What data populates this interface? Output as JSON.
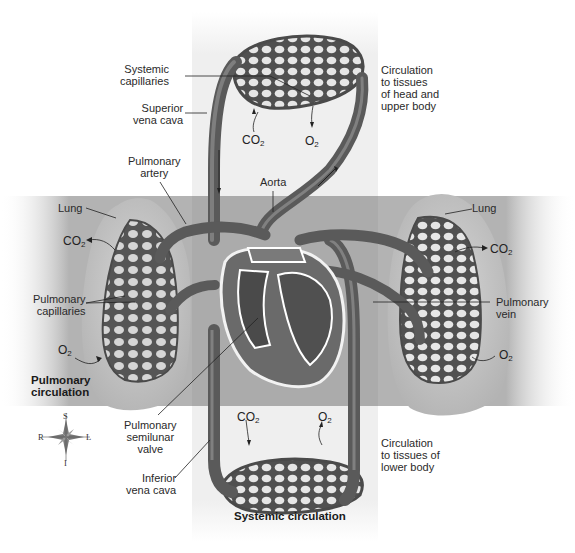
{
  "diagram": {
    "type": "anatomical-diagram"
  },
  "regions": {
    "pulmonary": {
      "label": "Pulmonary circulation",
      "band_color": "#a9a9a9"
    },
    "systemic": {
      "label": "Systemic circulation",
      "band_color": "#ececec"
    }
  },
  "labels": {
    "systemic_capillaries": {
      "line1": "Systemic",
      "line2": "capillaries"
    },
    "superior_vena_cava": {
      "line1": "Superior",
      "line2": "vena cava"
    },
    "pulmonary_artery": {
      "line1": "Pulmonary",
      "line2": "artery"
    },
    "aorta": "Aorta",
    "lung_left_side": "Lung",
    "lung_right_side": "Lung",
    "pulmonary_capillaries": {
      "line1": "Pulmonary",
      "line2": "capillaries"
    },
    "pulmonary_vein": {
      "line1": "Pulmonary",
      "line2": "vein"
    },
    "pulmonary_circulation": {
      "line1": "Pulmonary",
      "line2": "circulation"
    },
    "pulmonary_semilunar_valve": {
      "line1": "Pulmonary",
      "line2": "semilunar",
      "line3": "valve"
    },
    "inferior_vena_cava": {
      "line1": "Inferior",
      "line2": "vena cava"
    },
    "systemic_circulation": "Systemic circulation",
    "circulation_upper": {
      "line1": "Circulation",
      "line2": "to tissues",
      "line3": "of head and",
      "line4": "upper body"
    },
    "circulation_lower": {
      "line1": "Circulation",
      "line2": "to tissues of",
      "line3": "lower body"
    }
  },
  "gases": {
    "co2": {
      "base": "CO",
      "sub": "2"
    },
    "o2": {
      "base": "O",
      "sub": "2"
    }
  },
  "compass": {
    "superior": "S",
    "inferior": "I",
    "right": "R",
    "left": "L"
  },
  "colors": {
    "vessel": "#5f5f5f",
    "vessel_dark": "#3e3e3e",
    "vessel_highlight": "#8a8a8a",
    "lung_fill": "#c9c9c9",
    "capillary_hole": "#d8d8d8",
    "heart_fill": "#6b6b6b"
  }
}
